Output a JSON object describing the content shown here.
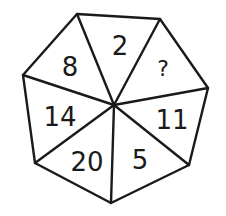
{
  "puzzle": {
    "shape": "heptagon",
    "segments": [
      {
        "label": "2",
        "position": "top"
      },
      {
        "label": "?",
        "position": "top-right"
      },
      {
        "label": "11",
        "position": "right"
      },
      {
        "label": "5",
        "position": "bottom-right"
      },
      {
        "label": "20",
        "position": "bottom-left"
      },
      {
        "label": "14",
        "position": "left"
      },
      {
        "label": "8",
        "position": "top-left"
      }
    ],
    "colors": {
      "stroke": "#1a1a1a",
      "background": "#ffffff"
    }
  }
}
